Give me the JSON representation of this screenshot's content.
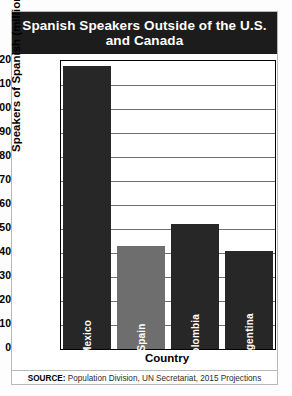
{
  "title": "Spanish Speakers Outside of the U.S. and Canada",
  "source_prefix": "SOURCE:",
  "source_text": " Population Division, UN Secretariat, 2015 Projections",
  "colors": {
    "title_band": "#1c1c1c",
    "bar_dark": "#272727",
    "bar_gray": "#6e6e6e",
    "gridline": "#6f6f6f",
    "axis": "#000000",
    "page": "#ffffff"
  },
  "chart_data": {
    "type": "bar",
    "title": "Spanish Speakers Outside of the U.S. and Canada",
    "xlabel": "Country",
    "ylabel": "Speakers of Spanish (millions)",
    "categories": [
      "Mexico",
      "Spain",
      "Colombia",
      "Argentina"
    ],
    "values": [
      118,
      43,
      52,
      41
    ],
    "bar_colors": [
      "#272727",
      "#6e6e6e",
      "#272727",
      "#272727"
    ],
    "ylim": [
      0,
      120
    ],
    "ytick_step": 10,
    "yticks": [
      120,
      110,
      100,
      90,
      80,
      70,
      60,
      50,
      40,
      30,
      20,
      10,
      0
    ],
    "grid": "horizontal",
    "legend": "none"
  }
}
